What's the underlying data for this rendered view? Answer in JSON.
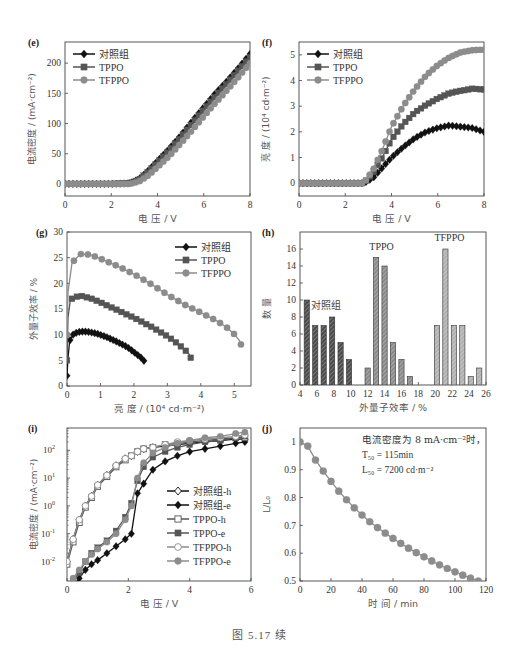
{
  "figure": {
    "caption": "图 5.17   续"
  },
  "chart_data": [
    {
      "id": "e",
      "panel_label": "(e)",
      "type": "line",
      "title": "",
      "xlabel": "电  压 / V",
      "ylabel": "电流密度 / (mA·cm⁻²)",
      "xlim": [
        0,
        8
      ],
      "ylim": [
        -20,
        235
      ],
      "xticks": [
        0,
        2,
        4,
        6,
        8
      ],
      "yticks": [
        0,
        50,
        100,
        150,
        200
      ],
      "grid": false,
      "legend_position": "upper-left",
      "x": [
        0,
        1,
        2,
        2.8,
        3.2,
        3.6,
        4,
        4.5,
        5,
        5.5,
        6,
        6.5,
        7,
        7.5,
        8
      ],
      "series": [
        {
          "name": "对照组",
          "marker": "diamond",
          "color": "#111111",
          "values": [
            0,
            0,
            0,
            1,
            8,
            22,
            38,
            58,
            80,
            104,
            127,
            150,
            170,
            192,
            215
          ]
        },
        {
          "name": "TPPO",
          "marker": "square",
          "color": "#555555",
          "values": [
            0,
            0,
            0,
            1,
            7,
            20,
            35,
            55,
            77,
            100,
            123,
            145,
            166,
            188,
            210
          ]
        },
        {
          "name": "TFPPO",
          "marker": "circle",
          "color": "#8c8c8c",
          "values": [
            0,
            0,
            0,
            0,
            4,
            14,
            28,
            46,
            67,
            89,
            112,
            134,
            155,
            177,
            200
          ]
        }
      ]
    },
    {
      "id": "f",
      "panel_label": "(f)",
      "type": "line",
      "title": "",
      "xlabel": "电  压 / V",
      "ylabel": "亮  度 / (10⁴ cd·m⁻²)",
      "xlim": [
        0,
        8
      ],
      "ylim": [
        -0.5,
        5.5
      ],
      "xticks": [
        0,
        2,
        4,
        6,
        8
      ],
      "yticks": [
        0,
        1,
        2,
        3,
        4,
        5
      ],
      "grid": false,
      "legend_position": "upper-left",
      "x": [
        0,
        1,
        2,
        2.8,
        3.2,
        3.6,
        4,
        4.5,
        5,
        5.5,
        6,
        6.5,
        7,
        7.5,
        8
      ],
      "series": [
        {
          "name": "对照组",
          "marker": "diamond",
          "color": "#111111",
          "values": [
            0,
            0,
            0,
            0,
            0.2,
            0.6,
            1.0,
            1.4,
            1.75,
            2.0,
            2.15,
            2.25,
            2.2,
            2.15,
            2.0
          ]
        },
        {
          "name": "TPPO",
          "marker": "square",
          "color": "#555555",
          "values": [
            0,
            0,
            0,
            0,
            0.4,
            1.0,
            1.7,
            2.3,
            2.75,
            3.05,
            3.3,
            3.5,
            3.6,
            3.68,
            3.65
          ]
        },
        {
          "name": "TFPPO",
          "marker": "circle",
          "color": "#8c8c8c",
          "values": [
            0,
            0,
            0,
            0,
            0.5,
            1.3,
            2.2,
            3.0,
            3.65,
            4.2,
            4.6,
            4.9,
            5.1,
            5.18,
            5.2
          ]
        }
      ]
    },
    {
      "id": "g",
      "panel_label": "(g)",
      "type": "line",
      "title": "",
      "xlabel": "亮  度 / (10⁴ cd·m⁻²)",
      "ylabel": "外量子效率 / %",
      "xlim": [
        0,
        5.5
      ],
      "ylim": [
        0,
        30
      ],
      "xticks": [
        0,
        1,
        2,
        3,
        4,
        5
      ],
      "yticks": [
        0,
        5,
        10,
        15,
        20,
        25,
        30
      ],
      "grid": false,
      "legend_position": "upper-right",
      "series": [
        {
          "name": "对照组",
          "marker": "diamond",
          "color": "#111111",
          "x": [
            0.0,
            0.03,
            0.08,
            0.2,
            0.4,
            0.6,
            0.9,
            1.2,
            1.5,
            1.8,
            2.0,
            2.2,
            2.3
          ],
          "values": [
            2.0,
            5.5,
            8.8,
            10.2,
            10.6,
            10.6,
            10.2,
            9.5,
            8.6,
            7.6,
            6.6,
            5.6,
            4.9
          ]
        },
        {
          "name": "TPPO",
          "marker": "square",
          "color": "#555555",
          "x": [
            0.0,
            0.03,
            0.1,
            0.2,
            0.4,
            0.7,
            1.0,
            1.5,
            2.0,
            2.5,
            3.0,
            3.3,
            3.5,
            3.65,
            3.7
          ],
          "values": [
            5.0,
            13.3,
            16.8,
            17.2,
            17.6,
            17.1,
            16.3,
            14.8,
            13.3,
            11.6,
            9.7,
            8.3,
            7.2,
            6.2,
            5.5
          ]
        },
        {
          "name": "TFPPO",
          "marker": "circle",
          "color": "#8c8c8c",
          "x": [
            0.0,
            0.03,
            0.15,
            0.4,
            0.7,
            1.0,
            1.5,
            2.0,
            2.5,
            3.0,
            3.5,
            4.0,
            4.5,
            4.8,
            5.0,
            5.15,
            5.2
          ],
          "values": [
            10.0,
            18.3,
            24.0,
            25.7,
            25.6,
            24.8,
            23.4,
            21.8,
            19.9,
            17.8,
            15.9,
            14.3,
            12.6,
            11.3,
            10.1,
            8.9,
            8.1
          ]
        }
      ]
    },
    {
      "id": "h",
      "panel_label": "(h)",
      "type": "bar",
      "title": "",
      "xlabel": "外量子效率 / %",
      "ylabel": "数  量",
      "xlim": [
        4,
        26
      ],
      "ylim": [
        0,
        18
      ],
      "xticks": [
        4,
        6,
        8,
        10,
        12,
        14,
        16,
        18,
        20,
        22,
        24,
        26
      ],
      "yticks": [
        0,
        2,
        4,
        6,
        8,
        10,
        12,
        14,
        16
      ],
      "grid": false,
      "annotations": [
        "对照组",
        "TPPO",
        "TFPPO"
      ],
      "series": [
        {
          "name": "对照组",
          "color": "#4a4a4a",
          "x": [
            4.8,
            5.8,
            6.8,
            7.8,
            8.8,
            9.8
          ],
          "values": [
            10,
            7,
            7,
            8,
            5,
            3
          ]
        },
        {
          "name": "TPPO",
          "color": "#8a8a8a",
          "x": [
            12.0,
            13.0,
            14.0,
            15.0,
            16.0,
            17.0
          ],
          "values": [
            2,
            15,
            14,
            5,
            3,
            1
          ]
        },
        {
          "name": "TFPPO",
          "color": "#b0b0b0",
          "x": [
            20.2,
            21.2,
            22.2,
            23.2,
            24.2,
            25.2
          ],
          "values": [
            7,
            16,
            7,
            7,
            1,
            2
          ]
        }
      ]
    },
    {
      "id": "i",
      "panel_label": "(i)",
      "type": "line",
      "title": "",
      "xlabel": "电  压 / V",
      "ylabel": "电流密度 / (mA·cm⁻²)",
      "xlim": [
        0,
        6
      ],
      "ylim_log10": [
        -2.7,
        2.8
      ],
      "yscale": "log",
      "xticks": [
        0,
        2,
        4,
        6
      ],
      "yticks": [
        "10⁻²",
        "10⁻¹",
        "10⁰",
        "10¹",
        "10²"
      ],
      "grid": false,
      "legend_position": "center-right",
      "x": [
        0.0,
        0.2,
        0.4,
        0.6,
        0.8,
        1.0,
        1.3,
        1.6,
        1.9,
        2.1,
        2.3,
        2.5,
        2.8,
        3.2,
        3.6,
        4.0,
        4.5,
        5.0,
        5.5,
        5.8
      ],
      "series": [
        {
          "name": "对照组-h",
          "marker": "diamond-open",
          "color": "#111111",
          "log10_values": [
            -2.0,
            -1.2,
            -0.5,
            0.0,
            0.35,
            0.75,
            1.1,
            1.45,
            1.7,
            1.8,
            1.95,
            2.05,
            2.1,
            2.15,
            2.2,
            2.25,
            2.3,
            2.35,
            2.4,
            2.4
          ]
        },
        {
          "name": "对照组-e",
          "marker": "diamond",
          "color": "#111111",
          "log10_values": [
            -3.0,
            -2.9,
            -2.6,
            -2.3,
            -2.1,
            -1.95,
            -1.7,
            -1.45,
            -1.2,
            -1.0,
            0.45,
            0.8,
            1.3,
            1.6,
            1.8,
            1.95,
            2.05,
            2.15,
            2.25,
            2.3
          ]
        },
        {
          "name": "TPPO-h",
          "marker": "square-open",
          "color": "#555555",
          "log10_values": [
            -2.1,
            -1.3,
            -0.6,
            -0.05,
            0.3,
            0.7,
            1.05,
            1.4,
            1.65,
            1.8,
            1.95,
            2.05,
            2.1,
            2.2,
            2.25,
            2.3,
            2.35,
            2.4,
            2.45,
            2.45
          ]
        },
        {
          "name": "TPPO-e",
          "marker": "square",
          "color": "#555555",
          "log10_values": [
            -2.9,
            -2.7,
            -2.4,
            -2.0,
            -1.7,
            -1.5,
            -1.25,
            -0.9,
            -0.4,
            0.1,
            0.9,
            1.4,
            1.75,
            1.95,
            2.1,
            2.2,
            2.3,
            2.35,
            2.45,
            2.5
          ]
        },
        {
          "name": "TFPPO-h",
          "marker": "circle-open",
          "color": "#8c8c8c",
          "log10_values": [
            -2.0,
            -1.2,
            -0.5,
            0.0,
            0.35,
            0.75,
            1.1,
            1.45,
            1.7,
            1.8,
            1.95,
            2.05,
            2.1,
            2.2,
            2.3,
            2.35,
            2.4,
            2.45,
            2.5,
            2.55
          ]
        },
        {
          "name": "TFPPO-e",
          "marker": "circle",
          "color": "#8c8c8c",
          "log10_values": [
            -2.9,
            -2.6,
            -2.3,
            -2.0,
            -1.75,
            -1.55,
            -1.3,
            -1.0,
            -0.5,
            0.0,
            1.0,
            1.55,
            1.9,
            2.1,
            2.25,
            2.35,
            2.45,
            2.5,
            2.6,
            2.65
          ]
        }
      ]
    },
    {
      "id": "j",
      "panel_label": "(j)",
      "type": "line",
      "title": "",
      "xlabel": "时  间 / min",
      "ylabel": "L/L₀",
      "xlim": [
        0,
        120
      ],
      "ylim": [
        0.5,
        1.05
      ],
      "xticks": [
        0,
        20,
        40,
        60,
        80,
        100,
        120
      ],
      "yticks": [
        0.5,
        0.6,
        0.7,
        0.8,
        0.9,
        1.0
      ],
      "grid": false,
      "annotations": [
        "电流密度为 8 mA·cm⁻²时，",
        "T₅₀ = 115min",
        "L₅₀ = 7200 cd·m⁻²"
      ],
      "series": [
        {
          "name": "L/L0",
          "marker": "circle",
          "color": "#8c8c8c",
          "x": [
            0,
            5,
            10,
            15,
            20,
            25,
            30,
            35,
            40,
            45,
            50,
            55,
            60,
            65,
            70,
            75,
            80,
            85,
            90,
            95,
            100,
            105,
            110,
            115
          ],
          "values": [
            1.0,
            0.985,
            0.935,
            0.895,
            0.858,
            0.823,
            0.792,
            0.763,
            0.737,
            0.713,
            0.692,
            0.672,
            0.653,
            0.635,
            0.618,
            0.602,
            0.587,
            0.572,
            0.558,
            0.545,
            0.533,
            0.521,
            0.51,
            0.5
          ]
        }
      ]
    }
  ]
}
